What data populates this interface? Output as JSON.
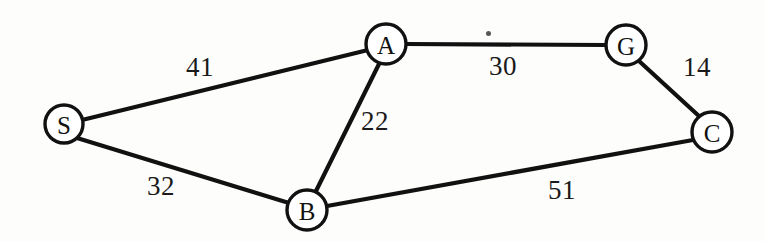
{
  "diagram": {
    "type": "node-link-graph",
    "background_color": "#fdfdfc",
    "stroke_color": "#111111",
    "nodes": [
      {
        "id": "S",
        "label": "S",
        "x": 64,
        "y": 124,
        "r": 19
      },
      {
        "id": "A",
        "label": "A",
        "x": 386,
        "y": 44,
        "r": 20
      },
      {
        "id": "G",
        "label": "G",
        "x": 626,
        "y": 45,
        "r": 20
      },
      {
        "id": "C",
        "label": "C",
        "x": 712,
        "y": 132,
        "r": 20
      },
      {
        "id": "B",
        "label": "B",
        "x": 307,
        "y": 210,
        "r": 20
      }
    ],
    "edges": [
      {
        "id": "S-A",
        "from": "S",
        "to": "A",
        "weight": "41",
        "label_x": 186,
        "label_y": 54
      },
      {
        "id": "A-G",
        "from": "A",
        "to": "G",
        "weight": "30",
        "label_x": 489,
        "label_y": 53
      },
      {
        "id": "G-C",
        "from": "G",
        "to": "C",
        "weight": "14",
        "label_x": 683,
        "label_y": 54
      },
      {
        "id": "A-B",
        "from": "A",
        "to": "B",
        "weight": "22",
        "label_x": 361,
        "label_y": 108
      },
      {
        "id": "S-B",
        "from": "S",
        "to": "B",
        "weight": "32",
        "label_x": 147,
        "label_y": 173
      },
      {
        "id": "B-C",
        "from": "B",
        "to": "C",
        "weight": "51",
        "label_x": 548,
        "label_y": 177
      }
    ],
    "artifacts": [
      {
        "id": "scan-speck",
        "x": 486,
        "y": 31
      }
    ]
  }
}
